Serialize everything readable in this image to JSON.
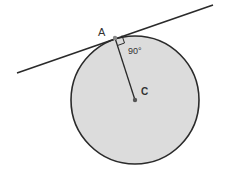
{
  "diagram": {
    "labels": {
      "point_a": "A",
      "center": "C",
      "angle": "90°"
    },
    "colors": {
      "circle_fill": "#dcdcdc",
      "stroke": "#2a2a2a"
    }
  }
}
